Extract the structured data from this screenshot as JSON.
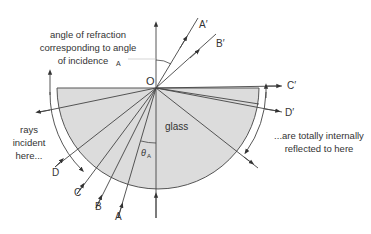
{
  "labels": {
    "angle_caption_1": "angle of refraction",
    "angle_caption_2": "corresponding to angle",
    "angle_caption_3": "of incidence",
    "angle_caption_sub": "A",
    "origin": "O",
    "glass": "glass",
    "theta": "θ",
    "theta_sub": "A",
    "incident_1": "rays",
    "incident_2": "incident",
    "incident_3": "here...",
    "reflected_1": "...are totally internally",
    "reflected_2": "reflected to here"
  },
  "rays": {
    "incoming": [
      "A",
      "B",
      "C",
      "D"
    ],
    "outgoing": [
      "A′",
      "B′",
      "C′",
      "D′"
    ]
  },
  "colors": {
    "glass_fill": "#dcdcdc",
    "line": "#444444",
    "text": "#333333"
  }
}
